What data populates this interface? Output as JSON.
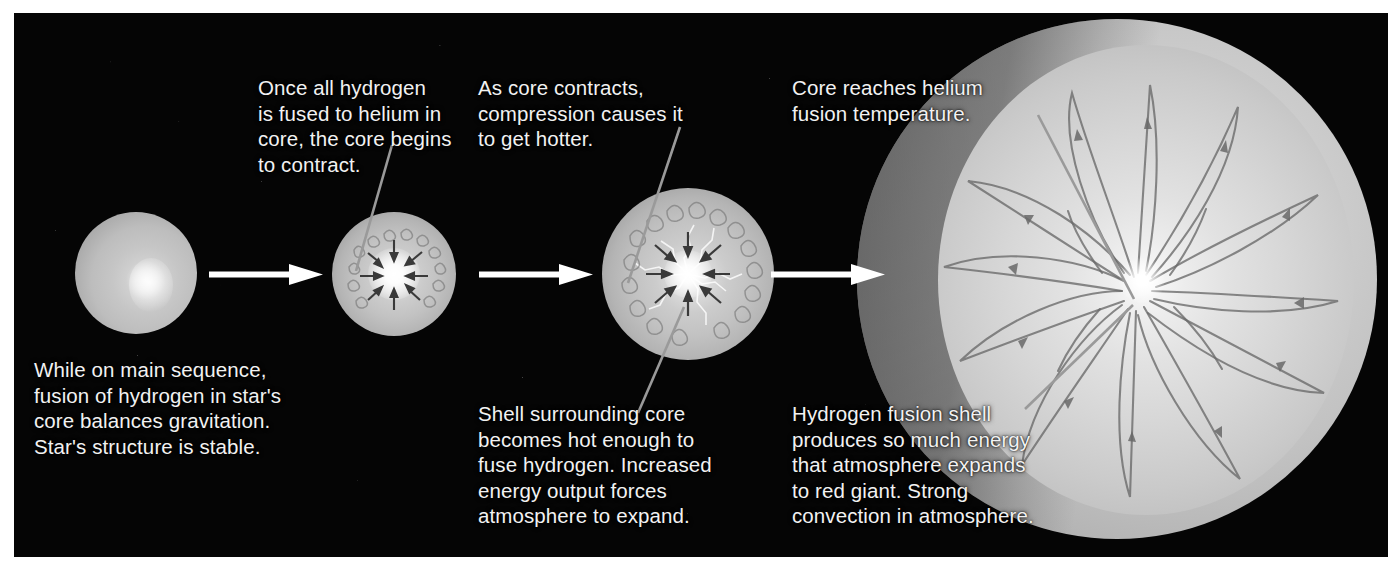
{
  "diagram": {
    "background_color": "#050505",
    "border_color": "#ffffff",
    "text_color": "#f2f2f2",
    "arrow_color": "#ffffff",
    "leader_line_color": "#9a9a9a"
  },
  "captions": {
    "stage1_bottom": "While on main sequence,\nfusion of hydrogen in star's\ncore balances gravitation.\nStar's structure is stable.",
    "stage2_top": "Once all hydrogen\nis fused to helium in\ncore, the core begins\nto contract.",
    "stage3_top": "As core contracts,\ncompression causes it\nto get hotter.",
    "stage3_bottom": "Shell surrounding core\nbecomes hot enough to\nfuse hydrogen. Increased\nenergy output forces\natmosphere to expand.",
    "stage4_top": "Core reaches helium\nfusion temperature.",
    "stage4_bottom": "Hydrogen fusion shell\nproduces so much energy\nthat atmosphere expands\nto red giant. Strong\nconvection in atmosphere."
  },
  "stages": [
    {
      "id": 1,
      "name": "main-sequence-star",
      "label": "Main sequence star"
    },
    {
      "id": 2,
      "name": "contracting-core-star",
      "label": "Core begins to contract"
    },
    {
      "id": 3,
      "name": "shell-fusion-star",
      "label": "Hydrogen shell fusion"
    },
    {
      "id": 4,
      "name": "red-giant-star",
      "label": "Red giant"
    }
  ],
  "transitions": [
    {
      "from": 1,
      "to": 2,
      "name": "stage-arrow-1"
    },
    {
      "from": 2,
      "to": 3,
      "name": "stage-arrow-2"
    },
    {
      "from": 3,
      "to": 4,
      "name": "stage-arrow-3"
    }
  ]
}
